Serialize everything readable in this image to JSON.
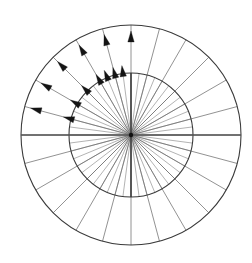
{
  "figure": {
    "background_color": "#ffffff"
  },
  "geometry": {
    "center_x": 131,
    "center_y": 135,
    "outer_radius": 110,
    "inner_radius": 62,
    "spoke_count": 24,
    "spoke_step_degrees": 15,
    "inner_spoke_count": 48,
    "inner_spoke_step_degrees": 7.5
  },
  "colors": {
    "circle_stroke": "#3a3a3a",
    "spoke_outer_stroke": "#6e6e6e",
    "spoke_inner_stroke": "#8a8a8a",
    "axis_stroke": "#555555",
    "arrow_fill": "#141414"
  },
  "axes": {
    "horizontal": {
      "label": "horizontal-axis",
      "from_degrees": 180,
      "to_degrees": 0
    },
    "vertical": {
      "label": "vertical-axis",
      "from_degrees": 90,
      "to_degrees": 270
    }
  },
  "chart_data": {
    "type": "scatter",
    "xlabel": "",
    "ylabel": "",
    "grid": true,
    "legend": "none",
    "rings": [
      {
        "name": "inner-circle",
        "radius": 62
      },
      {
        "name": "outer-circle",
        "radius": 110
      }
    ],
    "spoke_angles_degrees": [
      0,
      15,
      30,
      45,
      60,
      75,
      90,
      105,
      120,
      135,
      150,
      165,
      180,
      195,
      210,
      225,
      240,
      255,
      270,
      285,
      300,
      315,
      330,
      345
    ],
    "series": [
      {
        "name": "outer-vectors",
        "radius": 110,
        "arrow_tip_radius": 104,
        "angles_degrees": [
          105,
          120,
          135,
          150,
          165,
          90
        ]
      },
      {
        "name": "inner-vectors",
        "radius": 62,
        "arrow_tip_radius": 70,
        "angles_degrees": [
          97.5,
          105,
          112.5,
          120,
          135,
          150,
          165
        ]
      }
    ]
  },
  "elements": {
    "outer_circle_name": "outer-circle",
    "inner_circle_name": "inner-circle",
    "center_name": "origin-point"
  }
}
